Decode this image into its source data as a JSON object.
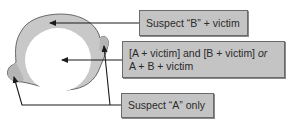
{
  "diagram": {
    "type": "region-overlap-illustration",
    "regions": {
      "outer": {
        "name": "suspect-b-region",
        "fill": "#c8c8c8"
      },
      "inner": {
        "name": "overlap-region",
        "fill": "#ffffff"
      },
      "lobes": {
        "name": "suspect-a-region",
        "fill": "#b8b8b8"
      }
    },
    "labels": {
      "suspect_b": "Suspect “B” + victim",
      "overlap_line1_a": "[A + victim] and [B + victim] ",
      "overlap_line1_or": "or",
      "overlap_line2": "A + B + victim",
      "suspect_a": "Suspect “A” only"
    },
    "colors": {
      "box_fill": "#c4c4c4",
      "box_border": "#6a6a6a",
      "arrow": "#1a1a1a",
      "outline": "#5a5a5a"
    }
  }
}
